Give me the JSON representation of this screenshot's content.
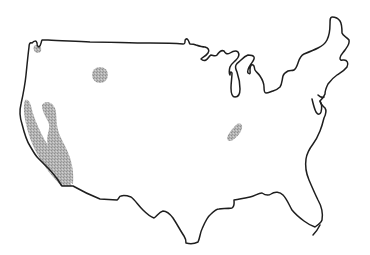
{
  "map": {
    "type": "outline-map",
    "subject": "contiguous United States",
    "labels": [],
    "colors": {
      "background": "#ffffff",
      "outline": "#1e1e1e",
      "shaded_region": "#a8a8a8"
    },
    "shaded_regions": [
      {
        "name": "california-coast-and-central-valley",
        "approx_location": "California"
      },
      {
        "name": "northern-rockies-spot",
        "approx_location": "Idaho / western Montana"
      },
      {
        "name": "southeastern-patch",
        "approx_location": "Tennessee / northern Alabama"
      },
      {
        "name": "puget-sound-spot",
        "approx_location": "northwestern Washington"
      }
    ]
  }
}
